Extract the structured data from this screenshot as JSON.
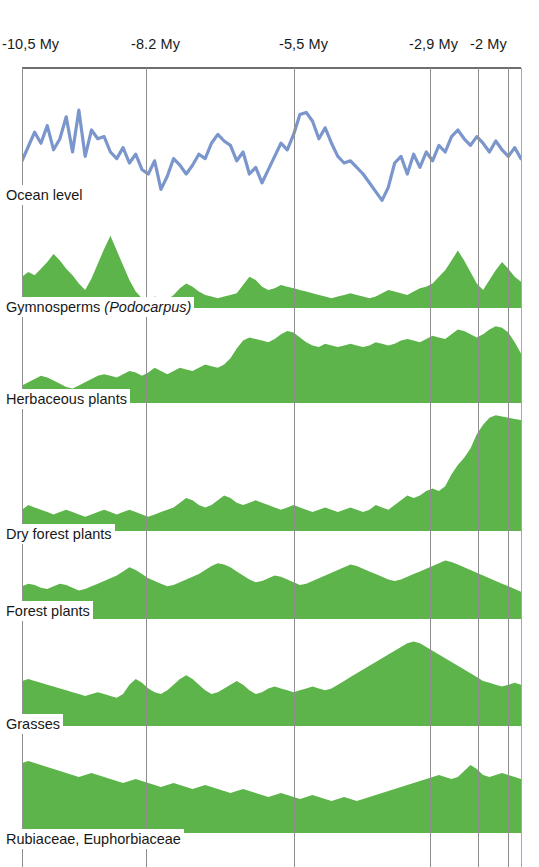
{
  "figure": {
    "type": "stratigraphic-pollen-diagram",
    "background": "#ffffff",
    "width": 539,
    "height": 867,
    "fill_color": "#5cb44a",
    "line_color": "#7b96cc",
    "gridline_color": "#8e8e8e"
  },
  "axis": {
    "label": "",
    "ticks": [
      {
        "text": "-10,5 My",
        "value": -10.5,
        "x": 22,
        "label_x": 2
      },
      {
        "text": "-8.2 My",
        "value": -8.2,
        "x": 146,
        "label_x": 131
      },
      {
        "text": "-5,5 My",
        "value": -5.5,
        "x": 294,
        "label_x": 279
      },
      {
        "text": "-2,9 My",
        "value": -2.9,
        "x": 430,
        "label_x": 409
      },
      {
        "text": "-2 My",
        "value": -2.0,
        "x": 478,
        "label_x": 470
      }
    ],
    "extra_gridlines": [
      508
    ],
    "frame_right": 521
  },
  "panels": [
    {
      "name": "ocean-level",
      "label": "Ocean level",
      "label_italic": "",
      "render": "line",
      "top": 70,
      "height": 145,
      "label_top": 185,
      "plot_height": 110
    },
    {
      "name": "gymnosperms",
      "label": "Gymnosperms ",
      "label_italic": "(Podocarpus)",
      "render": "area",
      "top": 215,
      "height": 93,
      "label_top": 297,
      "plot_height": 82
    },
    {
      "name": "herbaceous-plants",
      "label": "Herbaceous plants",
      "label_italic": "",
      "render": "area",
      "top": 308,
      "height": 95,
      "label_top": 389,
      "plot_height": 80
    },
    {
      "name": "dry-forest-plants",
      "label": "Dry forest plants",
      "label_italic": "",
      "render": "area",
      "top": 403,
      "height": 128,
      "label_top": 524,
      "plot_height": 118
    },
    {
      "name": "forest-plants",
      "label": "Forest plants",
      "label_italic": "",
      "render": "area",
      "top": 531,
      "height": 88,
      "label_top": 601,
      "plot_height": 68
    },
    {
      "name": "grasses",
      "label": "Grasses",
      "label_italic": "",
      "render": "area",
      "top": 619,
      "height": 107,
      "label_top": 714,
      "plot_height": 94
    },
    {
      "name": "rubiaceae-euphorbiaceae",
      "label": "Rubiaceae, Euphorbiaceae",
      "label_italic": "",
      "render": "area",
      "top": 726,
      "height": 107,
      "label_top": 829,
      "plot_height": 100
    }
  ],
  "chart_data": {
    "type": "area",
    "title": "",
    "xlabel": "Time (My)",
    "ylabel": "Relative abundance",
    "xlim": [
      -10.5,
      -1.6
    ],
    "grid": true,
    "legend": "none",
    "x_tick_labels": [
      "-10,5 My",
      "-8.2 My",
      "-5,5 My",
      "-2,9 My",
      "-2 My"
    ],
    "x_tick_values": [
      -10.5,
      -8.2,
      -5.5,
      -2.9,
      -2.0
    ],
    "series": [
      {
        "name": "Ocean level",
        "type": "line",
        "color": "#7b96cc",
        "values": [
          42,
          55,
          68,
          58,
          74,
          52,
          62,
          82,
          50,
          88,
          46,
          70,
          62,
          64,
          50,
          44,
          54,
          40,
          48,
          34,
          30,
          42,
          16,
          28,
          44,
          38,
          30,
          38,
          48,
          44,
          58,
          66,
          60,
          56,
          42,
          50,
          30,
          36,
          22,
          34,
          46,
          58,
          52,
          66,
          84,
          86,
          78,
          62,
          72,
          58,
          46,
          40,
          42,
          36,
          30,
          22,
          14,
          6,
          18,
          40,
          46,
          30,
          48,
          36,
          50,
          42,
          56,
          50,
          64,
          70,
          62,
          56,
          64,
          58,
          50,
          60,
          52,
          46,
          54,
          44
        ]
      },
      {
        "name": "Gymnosperms (Podocarpus)",
        "type": "area",
        "color": "#5cb44a",
        "values": [
          38,
          44,
          40,
          48,
          56,
          66,
          58,
          48,
          40,
          30,
          22,
          36,
          54,
          72,
          88,
          70,
          52,
          34,
          20,
          12,
          10,
          14,
          12,
          10,
          16,
          24,
          30,
          26,
          20,
          16,
          14,
          12,
          14,
          16,
          18,
          28,
          38,
          34,
          26,
          22,
          24,
          28,
          26,
          24,
          22,
          20,
          18,
          16,
          14,
          12,
          14,
          16,
          18,
          16,
          14,
          12,
          14,
          18,
          22,
          20,
          18,
          16,
          20,
          24,
          26,
          30,
          38,
          46,
          58,
          70,
          58,
          44,
          30,
          22,
          34,
          46,
          56,
          48,
          38,
          32
        ]
      },
      {
        "name": "Herbaceous plants",
        "type": "area",
        "color": "#5cb44a",
        "values": [
          22,
          26,
          30,
          34,
          32,
          28,
          24,
          20,
          18,
          22,
          26,
          30,
          34,
          36,
          34,
          32,
          36,
          40,
          38,
          34,
          38,
          44,
          40,
          36,
          40,
          44,
          42,
          40,
          44,
          48,
          46,
          44,
          48,
          56,
          68,
          78,
          82,
          80,
          78,
          76,
          80,
          86,
          90,
          88,
          82,
          76,
          72,
          70,
          74,
          72,
          70,
          72,
          74,
          72,
          70,
          72,
          76,
          74,
          72,
          74,
          78,
          80,
          78,
          76,
          80,
          84,
          82,
          80,
          86,
          92,
          90,
          86,
          82,
          86,
          92,
          96,
          94,
          88,
          76,
          62
        ]
      },
      {
        "name": "Dry forest plants",
        "type": "area",
        "color": "#5cb44a",
        "values": [
          18,
          22,
          20,
          18,
          16,
          14,
          16,
          18,
          16,
          14,
          12,
          14,
          16,
          18,
          16,
          14,
          16,
          18,
          16,
          14,
          12,
          14,
          16,
          18,
          20,
          24,
          28,
          26,
          22,
          20,
          22,
          26,
          30,
          28,
          24,
          22,
          24,
          26,
          24,
          22,
          20,
          18,
          20,
          22,
          20,
          18,
          16,
          18,
          20,
          18,
          16,
          18,
          20,
          18,
          16,
          18,
          22,
          20,
          18,
          22,
          26,
          30,
          28,
          30,
          34,
          36,
          34,
          38,
          48,
          56,
          62,
          70,
          82,
          90,
          96,
          98,
          97,
          96,
          95,
          94
        ]
      },
      {
        "name": "Forest plants",
        "type": "area",
        "color": "#5cb44a",
        "values": [
          48,
          52,
          50,
          46,
          44,
          48,
          52,
          50,
          46,
          42,
          44,
          48,
          52,
          56,
          60,
          64,
          70,
          76,
          72,
          66,
          60,
          56,
          52,
          48,
          50,
          54,
          58,
          62,
          66,
          72,
          78,
          82,
          80,
          76,
          70,
          64,
          58,
          54,
          56,
          60,
          64,
          62,
          58,
          54,
          50,
          52,
          56,
          60,
          64,
          68,
          72,
          76,
          80,
          78,
          74,
          70,
          66,
          62,
          58,
          56,
          58,
          62,
          66,
          70,
          74,
          78,
          82,
          86,
          84,
          80,
          76,
          72,
          68,
          64,
          60,
          56,
          52,
          48,
          44,
          40
        ]
      },
      {
        "name": "Grasses",
        "type": "area",
        "color": "#5cb44a",
        "values": [
          48,
          50,
          48,
          46,
          44,
          42,
          40,
          38,
          36,
          34,
          32,
          34,
          36,
          34,
          32,
          30,
          34,
          44,
          50,
          46,
          40,
          36,
          34,
          38,
          44,
          50,
          54,
          50,
          44,
          38,
          34,
          36,
          40,
          44,
          48,
          44,
          38,
          34,
          36,
          40,
          42,
          40,
          38,
          36,
          38,
          40,
          42,
          40,
          38,
          40,
          44,
          48,
          52,
          56,
          60,
          64,
          68,
          72,
          76,
          80,
          84,
          88,
          90,
          88,
          84,
          80,
          76,
          72,
          68,
          64,
          60,
          56,
          52,
          48,
          46,
          44,
          42,
          44,
          46,
          44
        ]
      },
      {
        "name": "Rubiaceae, Euphorbiaceae",
        "type": "area",
        "color": "#5cb44a",
        "values": [
          70,
          72,
          70,
          68,
          66,
          64,
          62,
          60,
          58,
          56,
          58,
          60,
          58,
          56,
          54,
          52,
          50,
          52,
          54,
          52,
          50,
          48,
          46,
          48,
          50,
          48,
          46,
          44,
          46,
          48,
          46,
          44,
          42,
          40,
          42,
          44,
          42,
          40,
          38,
          36,
          38,
          40,
          38,
          36,
          34,
          36,
          38,
          36,
          34,
          32,
          34,
          36,
          34,
          32,
          34,
          36,
          38,
          40,
          42,
          44,
          46,
          48,
          50,
          52,
          54,
          56,
          58,
          56,
          54,
          56,
          62,
          68,
          64,
          58,
          56,
          58,
          60,
          58,
          56,
          54
        ]
      }
    ]
  }
}
